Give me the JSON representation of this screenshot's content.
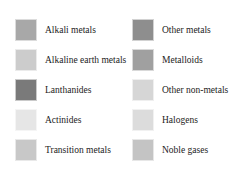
{
  "legend": {
    "left": [
      {
        "label": "Alkali metals",
        "color": "#a8a8a8"
      },
      {
        "label": "Alkaline earth metals",
        "color": "#cccccc"
      },
      {
        "label": "Lanthanides",
        "color": "#7a7a7a"
      },
      {
        "label": "Actinides",
        "color": "#e6e6e6"
      },
      {
        "label": "Transition metals",
        "color": "#c8c8c8"
      }
    ],
    "right": [
      {
        "label": "Other metals",
        "color": "#8e8e8e"
      },
      {
        "label": "Metalloids",
        "color": "#a0a0a0"
      },
      {
        "label": "Other non-metals",
        "color": "#d6d6d6"
      },
      {
        "label": "Halogens",
        "color": "#dcdcdc"
      },
      {
        "label": "Noble gases",
        "color": "#c4c4c4"
      }
    ]
  }
}
